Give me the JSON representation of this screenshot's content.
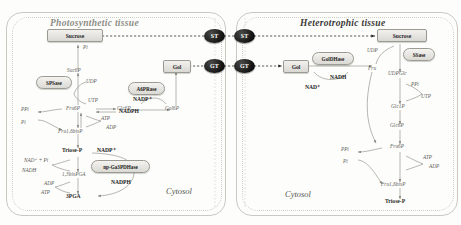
{
  "figure": {
    "tissues": [
      {
        "name": "photosynthetic",
        "label": "Photosynthetic tissue"
      },
      {
        "name": "heterotrophic",
        "label": "Heterotrophic tissue"
      }
    ],
    "compartments": [
      {
        "name": "cytosol-left",
        "label": "Cytosol"
      },
      {
        "name": "cytosol-right",
        "label": "Cytosol"
      }
    ]
  },
  "transporters": [
    {
      "id": "st-left",
      "label": "ST"
    },
    {
      "id": "st-right",
      "label": "ST"
    },
    {
      "id": "gt-left",
      "label": "GT"
    },
    {
      "id": "gt-right",
      "label": "GT"
    }
  ],
  "metabolite_boxes": [
    {
      "id": "sucrose-left",
      "label": "Sucrose"
    },
    {
      "id": "gol-left",
      "label": "Gol"
    },
    {
      "id": "sucrose-right",
      "label": "Sucrose"
    },
    {
      "id": "gol-right",
      "label": "Gol"
    }
  ],
  "enzymes": [
    {
      "id": "spsase",
      "label": "SPSase"
    },
    {
      "id": "a6prase",
      "label": "A6PRase"
    },
    {
      "id": "np-ga3pdhase",
      "label": "np-Ga3PDHase"
    },
    {
      "id": "goldhase",
      "label": "GolDHase"
    },
    {
      "id": "ssase",
      "label": "SSase"
    }
  ],
  "left_panel": {
    "metabolites": [
      {
        "id": "suc6p",
        "label": "Suc6P"
      },
      {
        "id": "fru6p",
        "label": "Fru6P"
      },
      {
        "id": "glc6p",
        "label": "Glc6P"
      },
      {
        "id": "gol6p",
        "label": "Gol6P"
      },
      {
        "id": "fru16bisp",
        "label": "Fru1,6bisP"
      },
      {
        "id": "triose-p",
        "label": "Triose-P"
      },
      {
        "id": "bpga",
        "label": "1,3bisPGA"
      },
      {
        "id": "pga3",
        "label": "3PGA"
      }
    ],
    "cofactors": [
      {
        "id": "pi-sucrose",
        "label": "Pi"
      },
      {
        "id": "udp",
        "label": "UDP"
      },
      {
        "id": "utp",
        "label": "UTP"
      },
      {
        "id": "ppi-fbp",
        "label": "PPi"
      },
      {
        "id": "pi-fbp",
        "label": "Pi"
      },
      {
        "id": "atp-pfk",
        "label": "ATP"
      },
      {
        "id": "adp-pfk",
        "label": "ADP"
      },
      {
        "id": "nadp-plus",
        "label": "NADP⁺"
      },
      {
        "id": "nadph",
        "label": "NADPH"
      },
      {
        "id": "nad-pi",
        "label": "NAD⁺ + Pi"
      },
      {
        "id": "nadh",
        "label": "NADH"
      },
      {
        "id": "adp-pgk",
        "label": "ADP"
      },
      {
        "id": "atp-pgk",
        "label": "ATP"
      },
      {
        "id": "nadp-plus-gapdh",
        "label": "NADP⁺"
      },
      {
        "id": "nadph-gapdh",
        "label": "NADPH"
      }
    ]
  },
  "right_panel": {
    "metabolites": [
      {
        "id": "fru",
        "label": "Fru"
      },
      {
        "id": "udpglc",
        "label": "UDPGlc"
      },
      {
        "id": "glc1p",
        "label": "Glc1P"
      },
      {
        "id": "glc6p-r",
        "label": "Glc6P"
      },
      {
        "id": "fru6p-r",
        "label": "Fru6P"
      },
      {
        "id": "fru16bisp-r",
        "label": "Fru1,6bisP"
      },
      {
        "id": "triose-p-r",
        "label": "Triose-P"
      }
    ],
    "cofactors": [
      {
        "id": "udp-r",
        "label": "UDP"
      },
      {
        "id": "nad-plus-r",
        "label": "NAD⁺"
      },
      {
        "id": "nadh-r",
        "label": "NADH"
      },
      {
        "id": "ppi-r",
        "label": "PPi"
      },
      {
        "id": "utp-r",
        "label": "UTP"
      },
      {
        "id": "ppi-fbp-r",
        "label": "PPi"
      },
      {
        "id": "pi-fbp-r",
        "label": "Pi"
      },
      {
        "id": "atp-pfk-r",
        "label": "ATP"
      },
      {
        "id": "adp-pfk-r",
        "label": "ADP"
      }
    ]
  }
}
